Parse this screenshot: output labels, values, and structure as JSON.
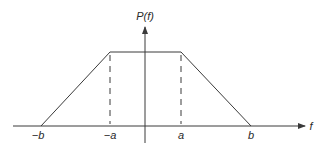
{
  "figure": {
    "y_axis_label": "P(f)",
    "x_axis_label": "f",
    "tick_labels": [
      "−b",
      "−a",
      "a",
      "b"
    ],
    "colors": {
      "line": "#3a3a3a",
      "text": "#2a2a2a",
      "background": "#ffffff"
    }
  },
  "shape": {
    "type": "trapezoid",
    "description": "Trapezoidal power spectrum: zero outside [−b, b], rising linearly from −b to −a, flat between −a and a, falling linearly from a to b",
    "points": [
      {
        "f": "−b",
        "P": 0
      },
      {
        "f": "−a",
        "P": "max"
      },
      {
        "f": "a",
        "P": "max"
      },
      {
        "f": "b",
        "P": 0
      }
    ],
    "dashed_guides_at": [
      "−a",
      "a"
    ]
  }
}
